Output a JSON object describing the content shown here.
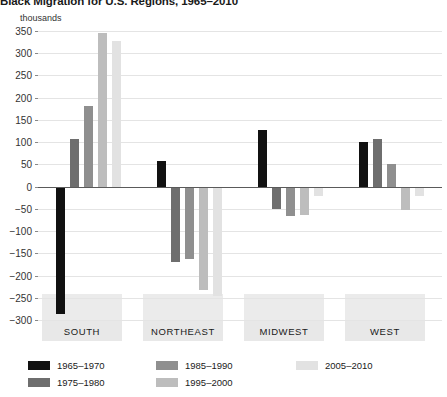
{
  "chart_data": {
    "type": "bar",
    "title": "Black Migration for U.S. Regions, 1965–2010",
    "unit_label": "thousands",
    "xlabel": "",
    "ylabel": "thousands",
    "ylim": [
      -300,
      350
    ],
    "ytick_step": 50,
    "ytick_labels": [
      "350",
      "300",
      "250",
      "200",
      "150",
      "100",
      "50",
      "0",
      "−50",
      "−100",
      "−150",
      "−200",
      "−250",
      "−300"
    ],
    "ytick_values": [
      350,
      300,
      250,
      200,
      150,
      100,
      50,
      0,
      -50,
      -100,
      -150,
      -200,
      -250,
      -300
    ],
    "grid": true,
    "legend_position": "bottom-left",
    "categories": [
      "SOUTH",
      "NORTHEAST",
      "MIDWEST",
      "WEST"
    ],
    "series": [
      {
        "name": "1965–1970",
        "color": "#111111",
        "values": [
          -287,
          58,
          127,
          101
        ]
      },
      {
        "name": "1975–1980",
        "color": "#6e6e6e",
        "values": [
          108,
          -170,
          -50,
          108
        ]
      },
      {
        "name": "1985–1990",
        "color": "#8f8f8f",
        "values": [
          182,
          -162,
          -66,
          50
        ]
      },
      {
        "name": "1995–2000",
        "color": "#bdbdbd",
        "values": [
          345,
          -232,
          -63,
          -52
        ]
      },
      {
        "name": "2005–2010",
        "color": "#e2e2e2",
        "values": [
          327,
          -245,
          -22,
          -22
        ]
      }
    ]
  },
  "colors": {
    "gridline": "#e4e4e4",
    "zero_axis": "#5a5a5a",
    "region_band": "#e8e8e8",
    "text": "#1a1a1a"
  }
}
